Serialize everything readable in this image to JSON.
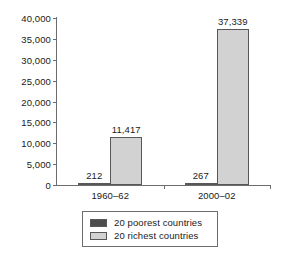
{
  "chart_data": {
    "type": "bar",
    "title": "",
    "subtitle": "",
    "xlabel": "",
    "ylabel": "",
    "categories": [
      "1960–62",
      "2000–02"
    ],
    "series": [
      {
        "name": "20 poorest countries",
        "color": "#4d4d4d",
        "values": [
          212,
          267
        ],
        "labels": [
          "212",
          "267"
        ]
      },
      {
        "name": "20 richest countries",
        "color": "#d2d2d2",
        "values": [
          11417,
          37339
        ],
        "labels": [
          "11,417",
          "37,339"
        ]
      }
    ],
    "ylim": [
      0,
      40000
    ],
    "ytick_values": [
      0,
      5000,
      10000,
      15000,
      20000,
      25000,
      30000,
      35000,
      40000
    ],
    "ytick_labels": [
      "0",
      "5,000",
      "10,000",
      "15,000",
      "20,000",
      "25,000",
      "30,000",
      "35,000",
      "40,000"
    ],
    "grid": false,
    "legend_position": "bottom",
    "axis_color": "#6d6d6d",
    "text_color": "#1a1a1a",
    "background": "#ffffff"
  }
}
